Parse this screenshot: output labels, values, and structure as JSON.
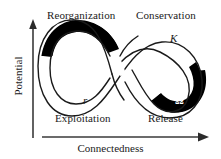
{
  "figure": {
    "background_color": "#ffffff",
    "line_color": "#1a1a1a",
    "fill_color": "#000000",
    "text_color": "#1a1a1a"
  },
  "axes": {
    "y": {
      "label": "Potential",
      "arrow": "up-arrow-icon"
    },
    "x": {
      "label": "Connectedness",
      "arrow": "right-arrow-icon"
    }
  },
  "quadrant_labels": {
    "top_left": "Reorganization",
    "top_right": "Conservation",
    "bottom_left": "Exploitation",
    "bottom_right": "Release"
  },
  "phase_symbols": {
    "alpha": "α",
    "kappa": "K",
    "r": "r",
    "omega": "Ω"
  }
}
